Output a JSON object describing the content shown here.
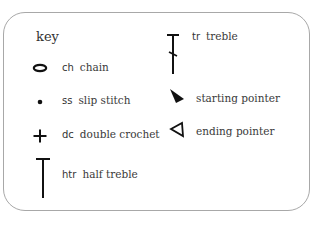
{
  "key": {
    "title": "key",
    "items": [
      {
        "symbol": "oval-chain-icon",
        "abbr": "ch",
        "label": "chain"
      },
      {
        "symbol": "dot-slip-stitch-icon",
        "abbr": "ss",
        "label": "slip stitch"
      },
      {
        "symbol": "plus-double-crochet-icon",
        "abbr": "dc",
        "label": "double crochet"
      },
      {
        "symbol": "t-half-treble-icon",
        "abbr": "htr",
        "label": "half treble"
      },
      {
        "symbol": "t-slash-treble-icon",
        "abbr": "tr",
        "label": "treble"
      },
      {
        "symbol": "filled-triangle-starting-pointer-icon",
        "abbr": "",
        "label": "starting pointer"
      },
      {
        "symbol": "outline-triangle-ending-pointer-icon",
        "abbr": "",
        "label": "ending pointer"
      }
    ]
  },
  "colors": {
    "border": "#a8a8a8",
    "ink": "#111111",
    "text": "#333333"
  }
}
